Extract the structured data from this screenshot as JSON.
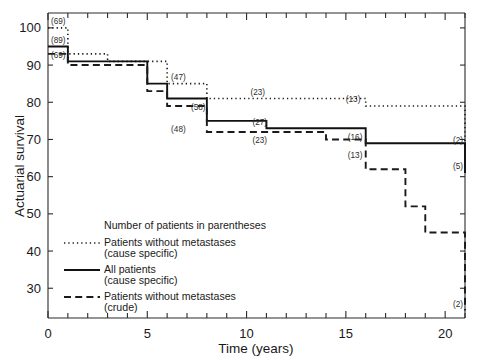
{
  "chart_data": {
    "type": "line",
    "title": "",
    "xlabel": "Time (years)",
    "ylabel": "Actuarial survival",
    "xlim": [
      0,
      21
    ],
    "ylim": [
      22,
      104
    ],
    "grid": false,
    "legend_position": "inside-lower-left",
    "x_ticks_major": [
      0,
      5,
      10,
      15,
      20
    ],
    "x_ticks_major_labels": [
      "0",
      "5",
      "10",
      "15",
      "20"
    ],
    "x_ticks_minor_step": 1,
    "y_ticks": [
      30,
      40,
      50,
      60,
      70,
      80,
      90,
      100
    ],
    "y_tick_labels": [
      "30",
      "40",
      "50",
      "60",
      "70",
      "80",
      "90",
      "100"
    ],
    "note": "Number of patients in parentheses",
    "series": [
      {
        "name": "Patients without metastases (cause specific)",
        "style": "dotted",
        "steps_x": [
          0,
          1,
          3,
          6,
          8,
          16,
          21
        ],
        "steps_y": [
          100,
          93,
          91,
          85,
          81,
          79,
          68
        ],
        "point_labels": [
          {
            "x": 0.15,
            "y": 100,
            "text": "(69)"
          },
          {
            "x": 6.2,
            "y": 85,
            "text": "(47)"
          },
          {
            "x": 10.2,
            "y": 81,
            "text": "(23)"
          },
          {
            "x": 15.0,
            "y": 79,
            "text": "(13)"
          },
          {
            "x": 20.4,
            "y": 68,
            "text": "(2)"
          }
        ]
      },
      {
        "name": "All patients (cause specific)",
        "style": "solid",
        "steps_x": [
          0,
          1,
          3,
          5,
          6,
          8,
          11,
          16,
          21
        ],
        "steps_y": [
          95,
          91,
          91,
          85,
          81,
          75,
          73,
          69,
          61
        ],
        "point_labels": [
          {
            "x": 0.15,
            "y": 95,
            "text": "(89)"
          },
          {
            "x": 7.2,
            "y": 77,
            "text": "(58)"
          },
          {
            "x": 10.3,
            "y": 73,
            "text": "(27)"
          },
          {
            "x": 15.1,
            "y": 69,
            "text": "(16)"
          },
          {
            "x": 20.4,
            "y": 61,
            "text": "(5)"
          }
        ]
      },
      {
        "name": "Patients without metastases (crude)",
        "style": "dashed",
        "steps_x": [
          0,
          1,
          3,
          5,
          6,
          8,
          11,
          14,
          16,
          18,
          19,
          21
        ],
        "steps_y": [
          93,
          90,
          90,
          83,
          79,
          72,
          72,
          70,
          62,
          52,
          45,
          24
        ],
        "point_labels": [
          {
            "x": 0.15,
            "y": 91,
            "text": "(69)"
          },
          {
            "x": 6.2,
            "y": 71,
            "text": "(48)"
          },
          {
            "x": 10.3,
            "y": 68,
            "text": "(23)"
          },
          {
            "x": 15.1,
            "y": 64,
            "text": "(13)"
          },
          {
            "x": 20.4,
            "y": 24,
            "text": "(2)"
          }
        ]
      }
    ]
  },
  "legend": {
    "note": "Number of patients in parentheses",
    "entries": [
      {
        "style": "dotted",
        "line1": "Patients without metastases",
        "line2": "(cause specific)"
      },
      {
        "style": "solid",
        "line1": "All patients",
        "line2": "(cause specific)"
      },
      {
        "style": "dashed",
        "line1": "Patients without metastases",
        "line2": "(crude)"
      }
    ]
  }
}
